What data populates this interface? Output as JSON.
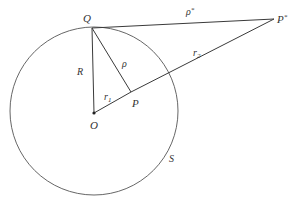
{
  "diagram": {
    "type": "geometry",
    "colors": {
      "stroke": "#3a3a3a",
      "circle": "#555555",
      "text": "#333333",
      "background": "#ffffff"
    },
    "circle": {
      "label": "S",
      "center": [
        94,
        111
      ],
      "radius": 84
    },
    "points": {
      "Q": {
        "label": "Q",
        "x": 92,
        "y": 28
      },
      "O": {
        "label": "O",
        "x": 94,
        "y": 113
      },
      "P": {
        "label": "P",
        "x": 131,
        "y": 92
      },
      "Pstar": {
        "label": "P",
        "sup": "*",
        "x": 274,
        "y": 19
      }
    },
    "segments": [
      {
        "from": "Q",
        "to": "O",
        "label": "R"
      },
      {
        "from": "Q",
        "to": "P",
        "label": "ρ"
      },
      {
        "from": "O",
        "to": "P",
        "label": "r",
        "sub": "1"
      },
      {
        "from": "P",
        "to": "Pstar",
        "label": "r",
        "sub": "2"
      },
      {
        "from": "Q",
        "to": "Pstar",
        "label": "ρ",
        "sup": "*"
      }
    ]
  }
}
